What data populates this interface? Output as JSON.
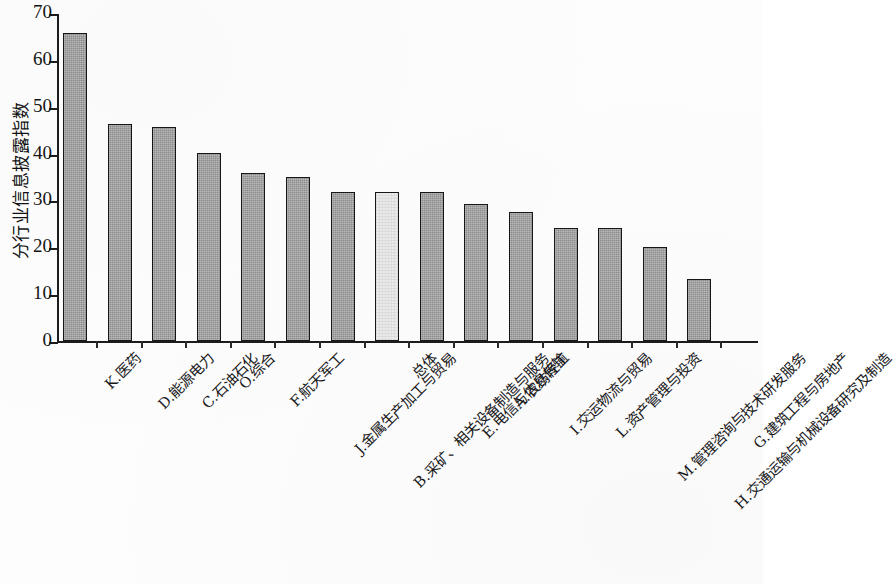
{
  "chart_data": {
    "type": "bar",
    "title": "",
    "subtitle": "",
    "xlabel": "",
    "ylabel": "分行业信息披露指数",
    "ylim": [
      0,
      70
    ],
    "ytick_labels": [
      "0",
      "10",
      "20",
      "30",
      "40",
      "50",
      "60",
      "70"
    ],
    "ytick_values": [
      0,
      10,
      20,
      30,
      40,
      50,
      60,
      70
    ],
    "grid": false,
    "legend": "none",
    "categories": [
      "K.医药",
      "D.能源电力",
      "C.石油石化",
      "O.综合",
      "F.航天军工",
      "J.金属生产加工与贸易",
      "B.采矿、相关设备制造与服务",
      "总体",
      "E.电信与信息传输",
      "A.农纺轻工",
      "I.交运物流与贸易",
      "L.资产管理与投资",
      "M.管理咨询与技术研发服务",
      "H.交通运输与机械设备研究及制造",
      "G.建筑工程与房地产"
    ],
    "values": [
      65.8,
      46.3,
      45.7,
      40.2,
      35.8,
      35.0,
      31.8,
      31.9,
      31.9,
      29.2,
      27.6,
      24.1,
      24.1,
      20.0,
      13.3
    ],
    "highlight_index": 7,
    "colors": {
      "bar": "#8d8d8d",
      "bar_highlight": "#ebebeb",
      "bar_border": "#161616",
      "axis": "#1c1c1c",
      "text": "#18181a",
      "background": "#fdfdfd"
    }
  }
}
